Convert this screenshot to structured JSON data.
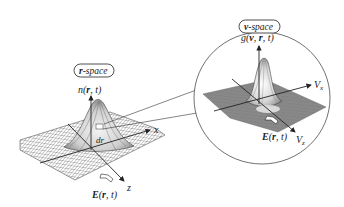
{
  "diagram": {
    "r_space": {
      "badge": "r-space",
      "badge_bold": "r",
      "badge_rest": "-space",
      "function_label": "n(r, t)",
      "fn_name": "n(",
      "fn_bold": "r",
      "fn_rest": ", t)",
      "axis_x": "x",
      "axis_z": "z",
      "element_label": "dr",
      "field_label": "E(r, t)",
      "field_bold_E": "E",
      "field_open": "(",
      "field_bold_r": "r",
      "field_rest": ", t)"
    },
    "v_space": {
      "badge": "v-space",
      "badge_bold": "v",
      "badge_rest": "-space",
      "function_label": "g(v, r, t)",
      "fn_name": "g(",
      "fn_bold_v": "v",
      "fn_sep": ", ",
      "fn_bold_r": "r",
      "fn_rest": ", t)",
      "axis_x": "Vx",
      "axis_x_main": "V",
      "axis_x_sub": "x",
      "axis_z": "Vz",
      "axis_z_main": "V",
      "axis_z_sub": "z",
      "field_label": "E(r, t)",
      "field_bold_E": "E",
      "field_open": "(",
      "field_bold_r": "r",
      "field_rest": ", t)"
    },
    "colors": {
      "ink": "#222222",
      "mesh": "#555555",
      "v_plane": "#8a8a8a",
      "background": "#ffffff"
    }
  }
}
